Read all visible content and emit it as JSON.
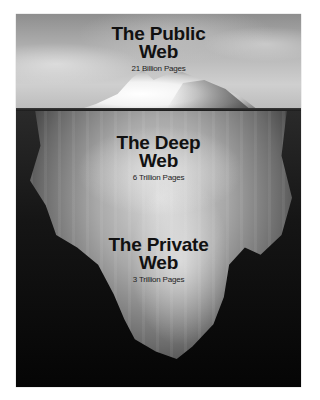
{
  "poster": {
    "description": "Iceberg metaphor diagram of the web layers",
    "layers": [
      {
        "title_line1": "The Public",
        "title_line2": "Web",
        "subtitle": "21 Billion Pages"
      },
      {
        "title_line1": "The Deep",
        "title_line2": "Web",
        "subtitle": "6 Trillion Pages"
      },
      {
        "title_line1": "The Private",
        "title_line2": "Web",
        "subtitle": "3 Trillion Pages"
      }
    ],
    "colors": {
      "sky": "#b9b9b9",
      "water": "#050505",
      "ice": "#f2f2f2",
      "text": "#111111"
    }
  }
}
